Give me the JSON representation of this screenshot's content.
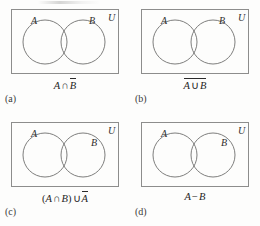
{
  "figure": {
    "symbols": {
      "intersection": "∩",
      "union": "∪",
      "minus": "−",
      "set_A": "A",
      "set_B": "B",
      "universe": "U",
      "paren_open": "(",
      "paren_close": ")"
    },
    "panels": [
      {
        "part": "(a)",
        "label_A": "A",
        "label_B": "B",
        "label_U": "U",
        "expression_text": "A ∩ B̄",
        "expression_parts": {
          "left_operand": "A",
          "operator": "∩",
          "right_operand": "B",
          "right_operand_complemented": true
        }
      },
      {
        "part": "(b)",
        "label_A": "A",
        "label_B": "B",
        "label_U": "U",
        "expression_text": "A ∪ B (complement of whole)",
        "expression_parts": {
          "left_operand": "A",
          "operator": "∪",
          "right_operand": "B",
          "whole_complemented": true
        }
      },
      {
        "part": "(c)",
        "label_A": "A",
        "label_B": "B",
        "label_U": "U",
        "expression_text": "(A ∩ B) ∪ Ā",
        "expression_parts": {
          "group_left": "A",
          "group_operator": "∩",
          "group_right": "B",
          "outer_operator": "∪",
          "outer_operand": "A",
          "outer_operand_complemented": true
        }
      },
      {
        "part": "(d)",
        "label_A": "A",
        "label_B": "B",
        "label_U": "U",
        "expression_text": "A − B",
        "expression_parts": {
          "left_operand": "A",
          "operator": "−",
          "right_operand": "B",
          "whole_complemented": false
        }
      }
    ],
    "venn": {
      "circle_left_cx": 34,
      "circle_right_cx": 72,
      "circle_cy": 33,
      "circle_r": 22
    },
    "colors": {
      "background": "#fdfdfc",
      "rectangle_border": "#8d8d8c",
      "circle_stroke": "#6f6f6e",
      "text": "#2b2b2b"
    }
  }
}
